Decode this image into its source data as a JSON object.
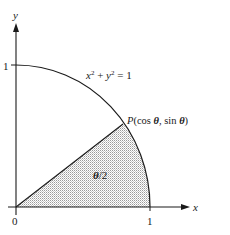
{
  "figure": {
    "axes": {
      "x_label": "x",
      "y_label": "y",
      "origin_label": "0",
      "x_tick_label": "1",
      "y_tick_label": "1"
    },
    "curve_label": {
      "lhs_x": "x",
      "exp1": "2",
      "plus": " + ",
      "lhs_y": "y",
      "exp2": "2",
      "rhs": " = 1"
    },
    "point_label": {
      "name": "P",
      "open": "(cos ",
      "theta1": "θ",
      "mid": ", sin ",
      "theta2": "θ",
      "close": ")"
    },
    "region_label": {
      "theta": "θ",
      "rest": "/2"
    },
    "colors": {
      "line": "#1a1a1a",
      "shade": "#d4d4d4",
      "background": "#ffffff"
    }
  }
}
